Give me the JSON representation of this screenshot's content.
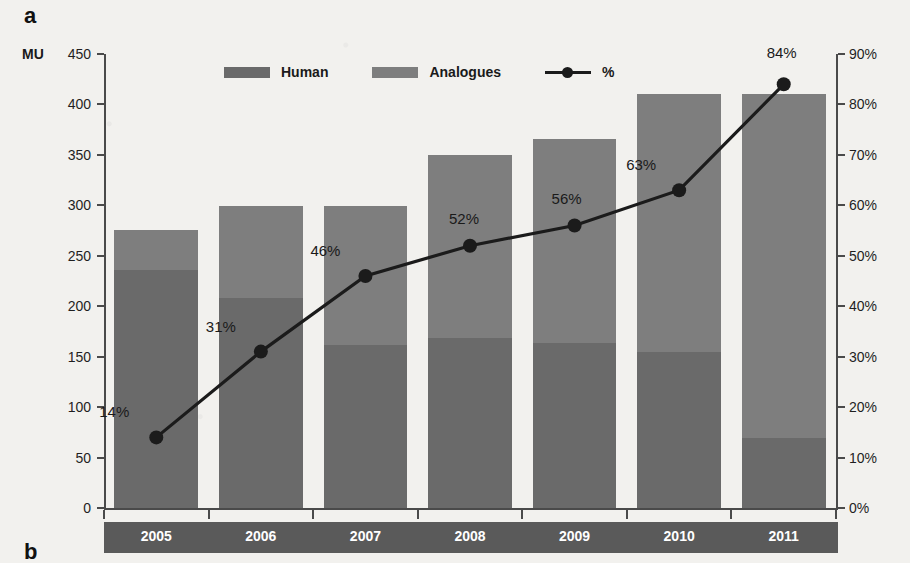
{
  "panel": {
    "letter_a": "a",
    "letter_b": "b"
  },
  "axis": {
    "unit_label": "MU",
    "left_ticks": [
      "450",
      "400",
      "350",
      "300",
      "250",
      "200",
      "150",
      "100",
      "50",
      "0"
    ],
    "right_ticks": [
      "90%",
      "80%",
      "70%",
      "60%",
      "50%",
      "40%",
      "30%",
      "20%",
      "10%",
      "0%"
    ]
  },
  "legend": {
    "items": [
      {
        "label": "Human",
        "kind": "swatch",
        "color": "#6a6a6a"
      },
      {
        "label": "Analogues",
        "kind": "swatch",
        "color": "#7e7e7e"
      },
      {
        "label": "%",
        "kind": "line-marker",
        "color": "#1b1b1b"
      }
    ]
  },
  "chart_data": {
    "type": "bar",
    "title": "",
    "subtitle": "",
    "xlabel": "",
    "ylabel": "MU",
    "y2label": "%",
    "ylim": [
      0,
      450
    ],
    "y2lim": [
      0,
      90
    ],
    "grid": false,
    "legend_position": "top-center",
    "stacked": true,
    "categories": [
      "2005",
      "2006",
      "2007",
      "2008",
      "2009",
      "2010",
      "2011"
    ],
    "series": [
      {
        "name": "Human",
        "type": "bar",
        "color": "#6a6a6a",
        "values": [
          236,
          208,
          162,
          168,
          164,
          155,
          69
        ]
      },
      {
        "name": "Analogues",
        "type": "bar",
        "color": "#7e7e7e",
        "values": [
          40,
          91,
          137,
          182,
          202,
          255,
          341
        ]
      }
    ],
    "totals": [
      276,
      299,
      299,
      350,
      366,
      410,
      410
    ],
    "line_series": {
      "name": "%",
      "type": "line",
      "color": "#1b1b1b",
      "axis": "right",
      "values": [
        14,
        31,
        46,
        52,
        56,
        63,
        84
      ],
      "labels": [
        "14%",
        "31%",
        "46%",
        "52%",
        "56%",
        "63%",
        "84%"
      ]
    }
  },
  "colors": {
    "background": "#f2f1ee",
    "human": "#6a6a6a",
    "analogues": "#7e7e7e",
    "line": "#1b1b1b",
    "axis": "#4a4a4a",
    "xband": "#5a5a5a",
    "text": "#1a1a1a"
  }
}
